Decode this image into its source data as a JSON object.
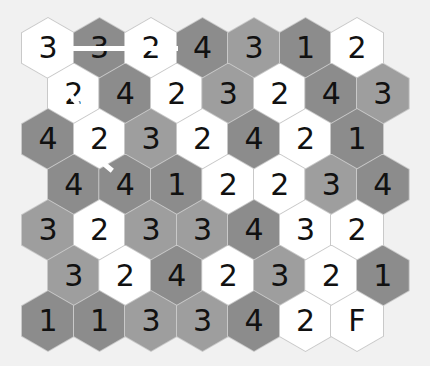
{
  "colors": {
    "background": "#f1f1f1",
    "white": "#ffffff",
    "mid": "#9e9e9e",
    "dark": "#8c8c8c",
    "text": "#111111"
  },
  "grid": {
    "rows": [
      {
        "offset": false,
        "cells": [
          {
            "v": "3",
            "c": "white"
          },
          {
            "v": "3",
            "c": "dark"
          },
          {
            "v": "2",
            "c": "white"
          },
          {
            "v": "4",
            "c": "dark"
          },
          {
            "v": "3",
            "c": "mid"
          },
          {
            "v": "1",
            "c": "dark"
          },
          {
            "v": "2",
            "c": "white"
          }
        ]
      },
      {
        "offset": true,
        "cells": [
          {
            "v": "2",
            "c": "white"
          },
          {
            "v": "4",
            "c": "dark"
          },
          {
            "v": "2",
            "c": "white"
          },
          {
            "v": "3",
            "c": "mid"
          },
          {
            "v": "2",
            "c": "white"
          },
          {
            "v": "4",
            "c": "dark"
          },
          {
            "v": "3",
            "c": "mid"
          }
        ]
      },
      {
        "offset": false,
        "cells": [
          {
            "v": "4",
            "c": "dark"
          },
          {
            "v": "2",
            "c": "white"
          },
          {
            "v": "3",
            "c": "mid"
          },
          {
            "v": "2",
            "c": "white"
          },
          {
            "v": "4",
            "c": "dark"
          },
          {
            "v": "2",
            "c": "white"
          },
          {
            "v": "1",
            "c": "dark"
          }
        ]
      },
      {
        "offset": true,
        "cells": [
          {
            "v": "4",
            "c": "dark"
          },
          {
            "v": "4",
            "c": "dark"
          },
          {
            "v": "1",
            "c": "dark"
          },
          {
            "v": "2",
            "c": "white"
          },
          {
            "v": "2",
            "c": "white"
          },
          {
            "v": "3",
            "c": "mid"
          },
          {
            "v": "4",
            "c": "dark"
          }
        ]
      },
      {
        "offset": false,
        "cells": [
          {
            "v": "3",
            "c": "mid"
          },
          {
            "v": "2",
            "c": "white"
          },
          {
            "v": "3",
            "c": "mid"
          },
          {
            "v": "3",
            "c": "mid"
          },
          {
            "v": "4",
            "c": "dark"
          },
          {
            "v": "3",
            "c": "white"
          },
          {
            "v": "2",
            "c": "white"
          }
        ]
      },
      {
        "offset": true,
        "cells": [
          {
            "v": "3",
            "c": "mid"
          },
          {
            "v": "2",
            "c": "white"
          },
          {
            "v": "4",
            "c": "dark"
          },
          {
            "v": "2",
            "c": "white"
          },
          {
            "v": "3",
            "c": "mid"
          },
          {
            "v": "2",
            "c": "white"
          },
          {
            "v": "1",
            "c": "dark"
          }
        ]
      },
      {
        "offset": false,
        "cells": [
          {
            "v": "1",
            "c": "dark"
          },
          {
            "v": "1",
            "c": "dark"
          },
          {
            "v": "3",
            "c": "mid"
          },
          {
            "v": "3",
            "c": "mid"
          },
          {
            "v": "4",
            "c": "dark"
          },
          {
            "v": "2",
            "c": "white"
          },
          {
            "v": "F",
            "c": "white"
          }
        ]
      }
    ]
  },
  "path": [
    {
      "x1": 70,
      "y1": 48,
      "x2": 178,
      "y2": 48
    },
    {
      "x1": 62,
      "y1": 84,
      "x2": 78,
      "y2": 104
    },
    {
      "x1": 100,
      "y1": 160,
      "x2": 112,
      "y2": 170
    }
  ]
}
